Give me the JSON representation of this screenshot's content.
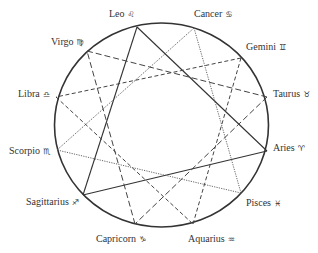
{
  "diagram": {
    "colors": {
      "circle": "#333333",
      "line": "#444444",
      "text": "#333333",
      "background": "#ffffff"
    },
    "signs": [
      {
        "id": "aries",
        "name": "Aries",
        "glyph": "♈"
      },
      {
        "id": "taurus",
        "name": "Taurus",
        "glyph": "♉"
      },
      {
        "id": "gemini",
        "name": "Gemini",
        "glyph": "♊"
      },
      {
        "id": "cancer",
        "name": "Cancer",
        "glyph": "♋"
      },
      {
        "id": "leo",
        "name": "Leo",
        "glyph": "♌"
      },
      {
        "id": "virgo",
        "name": "Virgo",
        "glyph": "♍"
      },
      {
        "id": "libra",
        "name": "Libra",
        "glyph": "♎"
      },
      {
        "id": "scorpio",
        "name": "Scorpio",
        "glyph": "♏"
      },
      {
        "id": "sagittarius",
        "name": "Sagittarius",
        "glyph": "♐"
      },
      {
        "id": "capricorn",
        "name": "Capricorn",
        "glyph": "♑"
      },
      {
        "id": "aquarius",
        "name": "Aquarius",
        "glyph": "♒"
      },
      {
        "id": "pisces",
        "name": "Pisces",
        "glyph": "♓"
      }
    ],
    "triangles": [
      {
        "element": "fire",
        "style": "solid",
        "vertices": [
          "leo",
          "aries",
          "sagittarius"
        ]
      },
      {
        "element": "water",
        "style": "dotted",
        "vertices": [
          "cancer",
          "pisces",
          "scorpio"
        ]
      },
      {
        "element": "earth",
        "style": "long-dash",
        "vertices": [
          "virgo",
          "taurus",
          "capricorn"
        ]
      },
      {
        "element": "air",
        "style": "short-dash",
        "vertices": [
          "gemini",
          "libra",
          "aquarius"
        ]
      }
    ]
  }
}
